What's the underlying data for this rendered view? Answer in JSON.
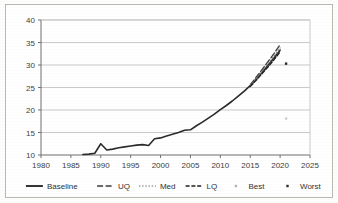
{
  "chart_data": {
    "type": "line",
    "title": "",
    "xlabel": "",
    "ylabel": "",
    "xlim": [
      1980,
      2025
    ],
    "ylim": [
      10,
      40
    ],
    "xticks": [
      1980,
      1985,
      1990,
      1995,
      2000,
      2005,
      2010,
      2015,
      2020,
      2025
    ],
    "yticks": [
      10,
      15,
      20,
      25,
      30,
      35,
      40
    ],
    "grid": "horizontal",
    "legend_position": "bottom",
    "background": "#ffffff",
    "frame_color": "#6f6f6f",
    "grid_color": "#c9c9c9",
    "series": [
      {
        "name": "Baseline",
        "style": "solid",
        "color": "#2b2b2b",
        "width": 1.6,
        "x": [
          1987,
          1988,
          1989,
          1990,
          1991,
          1992,
          1993,
          1994,
          1995,
          1996,
          1997,
          1998,
          1999,
          2000,
          2001,
          2002,
          2003,
          2004,
          2005,
          2006,
          2007,
          2008,
          2009,
          2010,
          2011,
          2012,
          2013,
          2014,
          2015,
          2016,
          2017,
          2018,
          2019,
          2020
        ],
        "values": [
          10.1,
          10.2,
          10.4,
          12.5,
          11.1,
          11.3,
          11.6,
          11.8,
          12.0,
          12.2,
          12.3,
          12.1,
          13.6,
          13.8,
          14.2,
          14.6,
          15.0,
          15.5,
          15.6,
          16.5,
          17.3,
          18.2,
          19.1,
          20.1,
          21.0,
          22.0,
          23.1,
          24.2,
          25.4,
          26.9,
          28.4,
          30.0,
          31.6,
          33.3
        ]
      },
      {
        "name": "UQ",
        "style": "long-dash",
        "color": "#3a3a3a",
        "width": 1.3,
        "x": [
          2015,
          2016,
          2017,
          2018,
          2019,
          2020
        ],
        "values": [
          25.6,
          27.3,
          29.0,
          30.8,
          32.6,
          34.5
        ]
      },
      {
        "name": "Med",
        "style": "dotted",
        "color": "#7e7e7e",
        "width": 1.1,
        "x": [
          2015,
          2016,
          2017,
          2018,
          2019,
          2020
        ],
        "values": [
          25.4,
          27.0,
          28.6,
          30.3,
          32.0,
          33.8
        ]
      },
      {
        "name": "LQ",
        "style": "dash-dot",
        "color": "#1f1f1f",
        "width": 1.3,
        "x": [
          2015,
          2016,
          2017,
          2018,
          2019,
          2020
        ],
        "values": [
          25.2,
          26.6,
          28.1,
          29.6,
          31.2,
          32.9
        ]
      },
      {
        "name": "Best",
        "style": "marker-dot",
        "color": "#cfcfcf",
        "width": 0,
        "x": [
          2021
        ],
        "values": [
          18.1
        ]
      },
      {
        "name": "Worst",
        "style": "marker-dot",
        "color": "#2b2b2b",
        "width": 0,
        "x": [
          2021
        ],
        "values": [
          30.3
        ]
      }
    ],
    "legend": [
      {
        "label": "Baseline",
        "style": "solid",
        "color": "#2b2b2b"
      },
      {
        "label": "UQ",
        "style": "long-dash",
        "color": "#3a3a3a"
      },
      {
        "label": "Med",
        "style": "dotted",
        "color": "#9a9a9a"
      },
      {
        "label": "LQ",
        "style": "dash-dot",
        "color": "#1f1f1f"
      },
      {
        "label": "Best",
        "style": "marker-dot",
        "color": "#b5b5b5"
      },
      {
        "label": "Worst",
        "style": "marker-dot",
        "color": "#2b2b2b"
      }
    ]
  }
}
